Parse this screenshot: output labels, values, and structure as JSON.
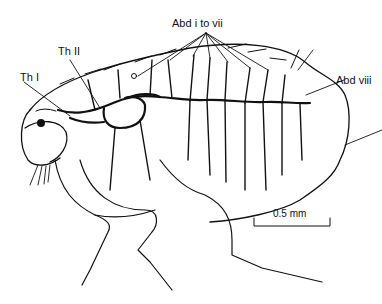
{
  "figure": {
    "labels": {
      "th1": "Th I",
      "th2": "Th II",
      "abd_i_vii": "Abd i to vii",
      "abd_viii": "Abd viii"
    },
    "scale_bar": {
      "label": "0.5 mm"
    },
    "colors": {
      "line": "#111111",
      "background": "#ffffff"
    }
  }
}
